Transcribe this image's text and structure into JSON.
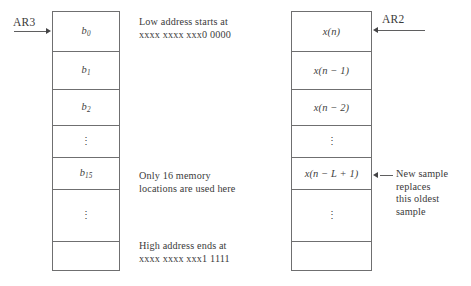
{
  "diagram": {
    "left_table": {
      "pointer_label": "AR3",
      "pointer_arrow_icon": "arrow-right-icon",
      "rows": [
        {
          "base": "b",
          "sub": "0",
          "kind": "label"
        },
        {
          "base": "b",
          "sub": "1",
          "kind": "label"
        },
        {
          "base": "b",
          "sub": "2",
          "kind": "label"
        },
        {
          "base": "⋮",
          "sub": "",
          "kind": "dots"
        },
        {
          "base": "b",
          "sub": "15",
          "kind": "label"
        },
        {
          "base": "⋮",
          "sub": "",
          "kind": "dots"
        },
        {
          "base": "",
          "sub": "",
          "kind": "empty"
        }
      ],
      "notes": [
        {
          "id": "low-address",
          "lines": [
            "Low address starts at",
            "xxxx xxxx xxx0 0000"
          ]
        },
        {
          "id": "only-16",
          "lines": [
            "Only 16 memory",
            "locations are used here"
          ]
        },
        {
          "id": "high-address",
          "lines": [
            "High address ends at",
            "xxxx xxxx xxx1 1111"
          ]
        }
      ]
    },
    "right_table": {
      "pointer_label": "AR2",
      "pointer_arrow_icon": "arrow-left-icon",
      "rows": [
        {
          "text": "x(n)",
          "kind": "label"
        },
        {
          "text": "x(n − 1)",
          "kind": "label"
        },
        {
          "text": "x(n − 2)",
          "kind": "label"
        },
        {
          "text": "⋮",
          "kind": "dots"
        },
        {
          "text": "x(n − L + 1)",
          "kind": "label"
        },
        {
          "text": "⋮",
          "kind": "dots"
        },
        {
          "text": "",
          "kind": "empty"
        }
      ],
      "notes": [
        {
          "id": "new-sample",
          "lines": [
            "New sample",
            "replaces",
            "this oldest",
            "sample"
          ],
          "arrow_icon": "arrow-left-icon"
        }
      ]
    },
    "colors": {
      "stroke": "#6f6f70",
      "text": "#3a3a3a",
      "background": "#ffffff"
    }
  }
}
